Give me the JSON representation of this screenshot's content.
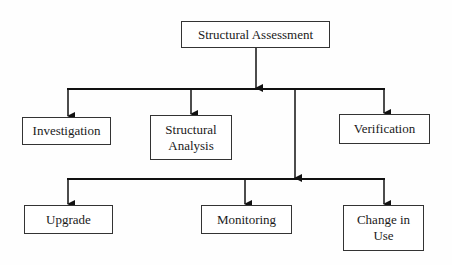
{
  "diagram": {
    "root": {
      "label": "Structural Assessment"
    },
    "level1": [
      {
        "label": "Investigation"
      },
      {
        "label": "Structural Analysis",
        "lines": [
          "Structural",
          "Analysis"
        ]
      },
      {
        "label": "Verification"
      }
    ],
    "level2": [
      {
        "label": "Upgrade"
      },
      {
        "label": "Monitoring"
      },
      {
        "label": "Change in Use",
        "lines": [
          "Change in",
          "Use"
        ]
      }
    ],
    "colors": {
      "line": "#111111",
      "box_border": "#333333",
      "text": "#1a1a1a",
      "background": "#fefefe"
    }
  }
}
